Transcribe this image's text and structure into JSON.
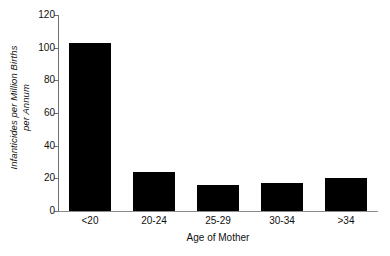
{
  "chart_data": {
    "type": "bar",
    "title": "",
    "subtitle": "",
    "xlabel": "Age of Mother",
    "ylabel": "Infanticides per Million Births per Annum",
    "ylabel_line1": "Infanticides per Million Births",
    "ylabel_line2": "per Annum",
    "categories": [
      "<20",
      "20-24",
      "25-29",
      "30-34",
      ">34"
    ],
    "values": [
      103,
      24,
      16,
      17,
      20
    ],
    "ylim": [
      0,
      120
    ],
    "yticks": [
      0,
      20,
      40,
      60,
      80,
      100,
      120
    ],
    "ytick_labels": [
      "0",
      "20",
      "40",
      "60",
      "80",
      "100",
      "120"
    ],
    "grid": false,
    "legend": null,
    "legend_position": "none",
    "bar_color": "#000000",
    "axis_color": "#6f6f6f",
    "background_color": "#ffffff",
    "annotations": []
  }
}
